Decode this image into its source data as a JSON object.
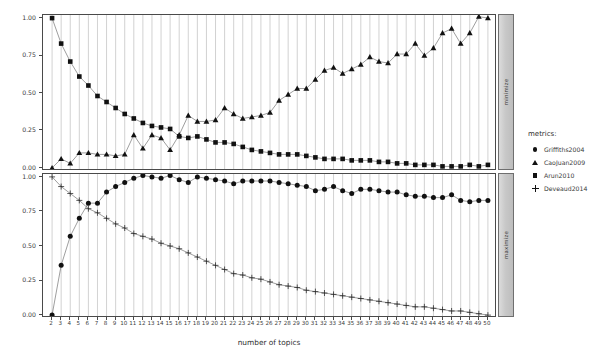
{
  "figure": {
    "kind": "lda-tuning-metrics-plot",
    "background": "#ffffff",
    "foreground": "#111111",
    "gridline_color": "#9a9a9a",
    "strip_color": "#c8c8c8"
  },
  "axes": {
    "x_label": "number of topics",
    "x_ticks": [
      2,
      3,
      4,
      5,
      6,
      7,
      8,
      9,
      10,
      11,
      12,
      13,
      14,
      15,
      16,
      17,
      18,
      19,
      20,
      21,
      22,
      23,
      24,
      25,
      26,
      27,
      28,
      29,
      30,
      31,
      32,
      33,
      34,
      35,
      36,
      37,
      38,
      39,
      40,
      41,
      42,
      43,
      44,
      45,
      46,
      47,
      48,
      49,
      50
    ],
    "y_ticks": [
      "0.00",
      "0.25",
      "0.50",
      "0.75",
      "1.00"
    ],
    "y_tick_values": [
      0.0,
      0.25,
      0.5,
      0.75,
      1.0
    ],
    "xlim": [
      2,
      50
    ],
    "ylim": [
      0,
      1
    ]
  },
  "panels": [
    {
      "id": "minimize",
      "strip_label": "minimize"
    },
    {
      "id": "maximize",
      "strip_label": "maximize"
    }
  ],
  "legend": {
    "title": "metrics:",
    "items": [
      {
        "label": "Griffiths2004",
        "marker": "circle-marker",
        "panel": "maximize"
      },
      {
        "label": "CaoJuan2009",
        "marker": "triangle-marker",
        "panel": "minimize"
      },
      {
        "label": "Arun2010",
        "marker": "square-marker",
        "panel": "minimize"
      },
      {
        "label": "Deveaud2014",
        "marker": "plus-marker",
        "panel": "maximize"
      }
    ]
  },
  "chart_data": {
    "type": "line",
    "title": "",
    "subtitle": "",
    "xlabel": "number of topics",
    "ylabel": "",
    "xlim": [
      2,
      50
    ],
    "ylim": [
      0,
      1
    ],
    "grid": true,
    "legend_position": "right",
    "legend_title": "metrics:",
    "x": [
      2,
      3,
      4,
      5,
      6,
      7,
      8,
      9,
      10,
      11,
      12,
      13,
      14,
      15,
      16,
      17,
      18,
      19,
      20,
      21,
      22,
      23,
      24,
      25,
      26,
      27,
      28,
      29,
      30,
      31,
      32,
      33,
      34,
      35,
      36,
      37,
      38,
      39,
      40,
      41,
      42,
      43,
      44,
      45,
      46,
      47,
      48,
      49,
      50
    ],
    "facets": [
      {
        "name": "minimize",
        "ytick_labels": [
          "0.00",
          "0.25",
          "0.50",
          "0.75",
          "1.00"
        ],
        "series": [
          {
            "name": "Arun2010",
            "marker": "square",
            "values": [
              1.0,
              0.83,
              0.71,
              0.61,
              0.55,
              0.48,
              0.44,
              0.4,
              0.36,
              0.33,
              0.3,
              0.28,
              0.27,
              0.26,
              0.21,
              0.2,
              0.21,
              0.19,
              0.17,
              0.17,
              0.16,
              0.14,
              0.12,
              0.11,
              0.1,
              0.09,
              0.09,
              0.09,
              0.08,
              0.07,
              0.06,
              0.06,
              0.06,
              0.05,
              0.05,
              0.05,
              0.04,
              0.04,
              0.03,
              0.03,
              0.02,
              0.02,
              0.02,
              0.01,
              0.01,
              0.01,
              0.02,
              0.01,
              0.02
            ]
          },
          {
            "name": "CaoJuan2009",
            "marker": "triangle",
            "values": [
              0.0,
              0.06,
              0.03,
              0.1,
              0.1,
              0.09,
              0.09,
              0.08,
              0.09,
              0.22,
              0.13,
              0.22,
              0.2,
              0.12,
              0.22,
              0.35,
              0.31,
              0.31,
              0.32,
              0.4,
              0.36,
              0.33,
              0.34,
              0.35,
              0.37,
              0.45,
              0.49,
              0.53,
              0.53,
              0.59,
              0.65,
              0.67,
              0.63,
              0.66,
              0.69,
              0.74,
              0.71,
              0.7,
              0.76,
              0.76,
              0.83,
              0.75,
              0.8,
              0.9,
              0.93,
              0.83,
              0.9,
              1.01,
              1.0
            ]
          }
        ]
      },
      {
        "name": "maximize",
        "ytick_labels": [
          "0.00",
          "0.25",
          "0.50",
          "0.75",
          "1.00"
        ],
        "series": [
          {
            "name": "Griffiths2004",
            "marker": "circle",
            "values": [
              0.0,
              0.36,
              0.57,
              0.7,
              0.81,
              0.81,
              0.89,
              0.93,
              0.96,
              0.99,
              1.01,
              1.0,
              0.99,
              1.01,
              0.98,
              0.96,
              1.0,
              0.99,
              0.98,
              0.97,
              0.95,
              0.97,
              0.97,
              0.97,
              0.97,
              0.96,
              0.95,
              0.94,
              0.93,
              0.9,
              0.91,
              0.93,
              0.9,
              0.88,
              0.91,
              0.91,
              0.9,
              0.89,
              0.89,
              0.87,
              0.86,
              0.86,
              0.85,
              0.85,
              0.87,
              0.83,
              0.82,
              0.83,
              0.83
            ]
          },
          {
            "name": "Deveaud2014",
            "marker": "plus",
            "values": [
              1.0,
              0.93,
              0.88,
              0.83,
              0.77,
              0.74,
              0.7,
              0.66,
              0.63,
              0.59,
              0.57,
              0.55,
              0.52,
              0.5,
              0.48,
              0.45,
              0.42,
              0.39,
              0.36,
              0.33,
              0.3,
              0.29,
              0.27,
              0.26,
              0.24,
              0.22,
              0.21,
              0.2,
              0.18,
              0.17,
              0.16,
              0.15,
              0.14,
              0.13,
              0.12,
              0.11,
              0.1,
              0.09,
              0.08,
              0.07,
              0.06,
              0.06,
              0.05,
              0.04,
              0.03,
              0.03,
              0.02,
              0.01,
              0.0
            ]
          }
        ]
      }
    ]
  }
}
